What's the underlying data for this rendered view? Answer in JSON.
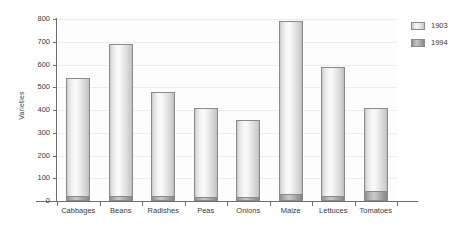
{
  "chart_data": {
    "type": "bar",
    "title": "",
    "subtitle": "",
    "xlabel": "",
    "ylabel": "Varieties",
    "ylim": [
      0,
      800
    ],
    "yticks": [
      0,
      100,
      200,
      300,
      400,
      500,
      600,
      700,
      800
    ],
    "ytick_labels": [
      "0",
      "100",
      "200",
      "300",
      "400",
      "500",
      "600",
      "700",
      "800"
    ],
    "grid": true,
    "legend_position": "right",
    "stacked": true,
    "categories": [
      "Cabbages",
      "Beans",
      "Radishes",
      "Peas",
      "Onions",
      "Maize",
      "Lettuces",
      "Tomatoes"
    ],
    "series": [
      {
        "name": "1903",
        "color": "#ededed",
        "values": [
          540,
          690,
          480,
          410,
          355,
          790,
          590,
          410
        ]
      },
      {
        "name": "1994",
        "color": "#9d9d9d",
        "values": [
          20,
          20,
          20,
          18,
          17,
          30,
          20,
          45
        ]
      }
    ]
  },
  "legend": {
    "items": [
      {
        "label": "1903",
        "swatch_class": "s1903"
      },
      {
        "label": "1994",
        "swatch_class": "s1994"
      }
    ]
  },
  "axes": {
    "y_title": "Varieties"
  },
  "colors": {
    "axis": "#6e6e6e",
    "grid": "#ececec",
    "text": "#3a3a3a",
    "bar_1903": "#ededed",
    "bar_1994": "#9d9d9d",
    "bar_outline": "#8a8a8a",
    "background": "#ffffff"
  }
}
